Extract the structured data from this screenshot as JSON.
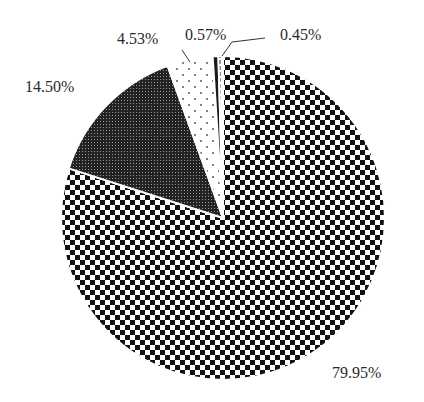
{
  "chart_data": {
    "type": "pie",
    "title": "",
    "start_angle_deg": 0,
    "direction": "clockwise",
    "legend": "none",
    "slices": [
      {
        "label": "79.95%",
        "value": 79.95,
        "pattern": "checkerboard"
      },
      {
        "label": "14.50%",
        "value": 14.5,
        "pattern": "dense-dark-dots"
      },
      {
        "label": "4.53%",
        "value": 4.53,
        "pattern": "sparse-dots"
      },
      {
        "label": "0.57%",
        "value": 0.57,
        "pattern": "solid-dark"
      },
      {
        "label": "0.45%",
        "value": 0.45,
        "pattern": "vertical-lines"
      }
    ]
  },
  "labels": {
    "s0": "79.95%",
    "s1": "14.50%",
    "s2": "4.53%",
    "s3": "0.57%",
    "s4": "0.45%"
  }
}
